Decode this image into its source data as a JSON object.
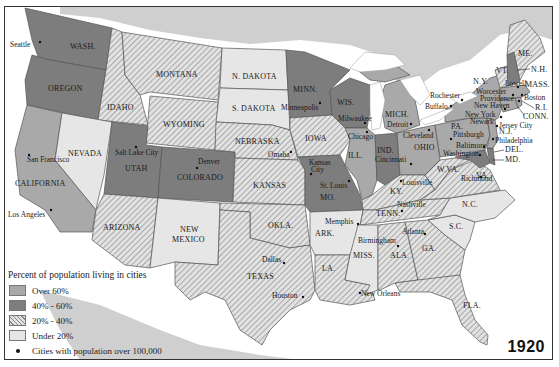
{
  "map": {
    "year": "1920",
    "legend": {
      "title": "Percent of population living in cities",
      "items": [
        {
          "label": "Over 60%",
          "color": "#a9a9a9",
          "pattern": "solid"
        },
        {
          "label": "40% - 60%",
          "color": "#7d7d7d",
          "pattern": "solid"
        },
        {
          "label": "20% - 40%",
          "color": "#d4d4d4",
          "pattern": "hatched"
        },
        {
          "label": "Under 20%",
          "color": "#e6e6e6",
          "pattern": "solid"
        }
      ],
      "city_marker_label": "Cities with population over 100,000"
    },
    "colors": {
      "over60": "#a9a9a9",
      "40to60": "#7d7d7d",
      "20to40": "#d4d4d4",
      "under20": "#e6e6e6",
      "background_land": "#cfcfcf",
      "water": "#ffffff"
    },
    "states": {
      "wash": {
        "label": "WASH.",
        "category": "40% - 60%"
      },
      "oregon": {
        "label": "OREGON",
        "category": "40% - 60%"
      },
      "california": {
        "label": "CALIFORNIA",
        "category": "Over 60%"
      },
      "idaho": {
        "label": "IDAHO",
        "category": "20% - 40%"
      },
      "nevada": {
        "label": "NEVADA",
        "category": "Under 20%"
      },
      "montana": {
        "label": "MONTANA",
        "category": "20% - 40%"
      },
      "wyoming": {
        "label": "WYOMING",
        "category": "20% - 40%"
      },
      "utah": {
        "label": "UTAH",
        "category": "40% - 60%"
      },
      "colorado": {
        "label": "COLORADO",
        "category": "40% - 60%"
      },
      "arizona": {
        "label": "ARIZONA",
        "category": "20% - 40%"
      },
      "new_mexico": {
        "label1": "NEW",
        "label2": "MEXICO",
        "category": "Under 20%"
      },
      "n_dakota": {
        "label": "N. DAKOTA",
        "category": "Under 20%"
      },
      "s_dakota": {
        "label": "S. DAKOTA",
        "category": "Under 20%"
      },
      "nebraska": {
        "label": "NEBRASKA",
        "category": "20% - 40%"
      },
      "kansas": {
        "label": "KANSAS",
        "category": "20% - 40%"
      },
      "okla": {
        "label": "OKLA.",
        "category": "20% - 40%"
      },
      "texas": {
        "label": "TEXAS",
        "category": "20% - 40%"
      },
      "minn": {
        "label": "MINN.",
        "category": "40% - 60%"
      },
      "iowa": {
        "label": "IOWA",
        "category": "20% - 40%"
      },
      "mo": {
        "label": "MO.",
        "category": "40% - 60%"
      },
      "ark": {
        "label": "ARK.",
        "category": "Under 20%"
      },
      "la": {
        "label": "LA.",
        "category": "20% - 40%"
      },
      "wis": {
        "label": "WIS.",
        "category": "40% - 60%"
      },
      "ill": {
        "label": "ILL.",
        "category": "Over 60%"
      },
      "miss": {
        "label": "MISS.",
        "category": "Under 20%"
      },
      "mich": {
        "label": "MICH.",
        "category": "Over 60%"
      },
      "ind": {
        "label": "IND.",
        "category": "40% - 60%"
      },
      "ohio": {
        "label": "OHIO",
        "category": "Over 60%"
      },
      "ky": {
        "label": "KY.",
        "category": "20% - 40%"
      },
      "tenn": {
        "label": "TENN.",
        "category": "20% - 40%"
      },
      "ala": {
        "label": "ALA.",
        "category": "20% - 40%"
      },
      "ga": {
        "label": "GA.",
        "category": "20% - 40%"
      },
      "fla": {
        "label": "FLA.",
        "category": "20% - 40%"
      },
      "sc": {
        "label": "S.C.",
        "category": "Under 20%"
      },
      "nc": {
        "label": "N.C.",
        "category": "Under 20%"
      },
      "va": {
        "label": "VA.",
        "category": "20% - 40%"
      },
      "wva": {
        "label": "W.VA.",
        "category": "20% - 40%"
      },
      "pa": {
        "label": "PA.",
        "category": "Over 60%"
      },
      "ny": {
        "label": "N.Y.",
        "category": "Over 60%"
      },
      "vt": {
        "label": "VT.",
        "category": "20% - 40%"
      },
      "me": {
        "label": "ME.",
        "category": "20% - 40%"
      },
      "nh": {
        "label": "N.H.",
        "category": "40% - 60%"
      },
      "mass": {
        "label": "MASS.",
        "category": "Over 60%"
      },
      "ri": {
        "label": "R.I.",
        "category": "Over 60%"
      },
      "conn": {
        "label": "CONN.",
        "category": "Over 60%"
      },
      "nj": {
        "label": "N.J.",
        "category": "Over 60%"
      },
      "del": {
        "label": "DEL.",
        "category": "40% - 60%"
      },
      "md": {
        "label": "MD.",
        "category": "40% - 60%"
      }
    },
    "cities": {
      "seattle": "Seattle",
      "san_francisco": "San Francisco",
      "los_angeles": "Los Angeles",
      "salt_lake_city": "Salt Lake City",
      "denver": "Denver",
      "minneapolis": "Minneapolis",
      "milwaukee": "Milwaukee",
      "chicago": "Chicago",
      "omaha": "Omaha",
      "kansas_city_1": "Kansas",
      "kansas_city_2": "City",
      "st_louis": "St. Louis",
      "detroit": "Detroit",
      "cleveland": "Cleveland",
      "cincinnati": "Cincinnati",
      "louisville": "Louisville",
      "nashville": "Nashville",
      "memphis": "Memphis",
      "birmingham": "Birmingham",
      "atlanta": "Atlanta",
      "dallas": "Dallas",
      "houston": "Houston",
      "new_orleans": "New Orleans",
      "rochester": "Rochester",
      "buffalo": "Buffalo",
      "pittsburgh": "Pittsburgh",
      "baltimore": "Baltimore",
      "washington": "Washington",
      "richmond": "Richmond",
      "philadelphia": "Philadelphia",
      "newark": "Newark",
      "jersey_city": "Jersey City",
      "new_york": "New York",
      "new_haven": "New Haven",
      "providence": "Providence",
      "worcester": "Worcester",
      "lowell": "Lowell",
      "boston": "Boston"
    }
  }
}
